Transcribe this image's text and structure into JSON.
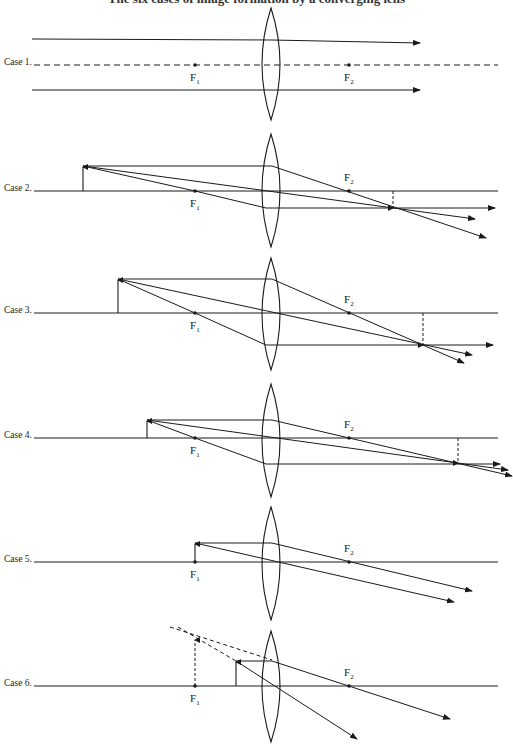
{
  "title": "The six cases of image formation by a converging lens",
  "colors": {
    "ink": "#1a1a1a",
    "background": "#ffffff"
  },
  "lens": {
    "center_x": 271,
    "half_width": 9
  },
  "focal_points": {
    "f1_x": 195,
    "f2_x": 349,
    "f1_label": "F",
    "f1_sub": "1",
    "f2_label": "F",
    "f2_sub": "2"
  },
  "cases": [
    {
      "label": "Case 1.",
      "axis_y": 65,
      "axis_style": "dashed",
      "lens_top": 8,
      "lens_bottom": 120,
      "object": null,
      "rays": [
        {
          "points": [
            [
              32,
              39
            ],
            [
              272,
              40
            ],
            [
              420,
              43
            ]
          ],
          "arrow": true,
          "style": "solid",
          "via_f2": true
        },
        {
          "points": [
            [
              32,
              90
            ],
            [
              272,
              90
            ],
            [
              420,
              90
            ]
          ],
          "arrow": true,
          "style": "solid",
          "via_f2": true
        }
      ],
      "image": null
    },
    {
      "label": "Case 2.",
      "axis_y": 191,
      "lens_top": 134,
      "lens_bottom": 247,
      "object": {
        "x": 83,
        "tip_y": 166
      },
      "rays": [
        {
          "points": [
            [
              83,
              166
            ],
            [
              272,
              166
            ],
            [
              486,
              238
            ]
          ],
          "arrow": true,
          "style": "solid"
        },
        {
          "points": [
            [
              83,
              166
            ],
            [
              475,
              219
            ]
          ],
          "arrow": true,
          "style": "solid"
        },
        {
          "points": [
            [
              83,
              166
            ],
            [
              195,
              191
            ],
            [
              266,
              208
            ],
            [
              495,
              208
            ]
          ],
          "arrow": true,
          "style": "solid"
        }
      ],
      "image": {
        "x": 393,
        "top_y": 191,
        "bottom_y": 208,
        "style": "dashed"
      }
    },
    {
      "label": "Case 3.",
      "axis_y": 313,
      "lens_top": 258,
      "lens_bottom": 370,
      "object": {
        "x": 118,
        "tip_y": 279
      },
      "rays": [
        {
          "points": [
            [
              118,
              279
            ],
            [
              272,
              279
            ],
            [
              464,
              363
            ]
          ],
          "arrow": true,
          "style": "solid"
        },
        {
          "points": [
            [
              118,
              279
            ],
            [
              472,
              355
            ]
          ],
          "arrow": true,
          "style": "solid"
        },
        {
          "points": [
            [
              118,
              279
            ],
            [
              195,
              313
            ],
            [
              266,
              345
            ],
            [
              493,
              345
            ]
          ],
          "arrow": true,
          "style": "solid"
        }
      ],
      "image": {
        "x": 423,
        "top_y": 313,
        "bottom_y": 345,
        "style": "dashed"
      }
    },
    {
      "label": "Case 4.",
      "axis_y": 438,
      "lens_top": 384,
      "lens_bottom": 497,
      "object": {
        "x": 147,
        "tip_y": 420
      },
      "rays": [
        {
          "points": [
            [
              147,
              420
            ],
            [
              272,
              420
            ],
            [
              512,
              476
            ]
          ],
          "arrow": true,
          "style": "solid"
        },
        {
          "points": [
            [
              147,
              420
            ],
            [
              508,
              470
            ]
          ],
          "arrow": true,
          "style": "solid"
        },
        {
          "points": [
            [
              147,
              420
            ],
            [
              195,
              438
            ],
            [
              266,
              464
            ],
            [
              500,
              464
            ]
          ],
          "arrow": true,
          "style": "solid"
        }
      ],
      "image": {
        "x": 458,
        "top_y": 438,
        "bottom_y": 463,
        "style": "dashed"
      }
    },
    {
      "label": "Case 5.",
      "axis_y": 562,
      "lens_top": 507,
      "lens_bottom": 620,
      "object": {
        "x": 195,
        "tip_y": 543
      },
      "rays": [
        {
          "points": [
            [
              195,
              543
            ],
            [
              272,
              543
            ],
            [
              472,
              591
            ]
          ],
          "arrow": true,
          "style": "solid"
        },
        {
          "points": [
            [
              195,
              543
            ],
            [
              454,
              602
            ]
          ],
          "arrow": true,
          "style": "solid"
        }
      ],
      "image": null
    },
    {
      "label": "Case 6.",
      "axis_y": 686,
      "lens_top": 631,
      "lens_bottom": 742,
      "object": {
        "x": 236,
        "tip_y": 661
      },
      "rays": [
        {
          "points": [
            [
              236,
              661
            ],
            [
              272,
              661
            ],
            [
              450,
              719
            ]
          ],
          "arrow": true,
          "style": "solid"
        },
        {
          "points": [
            [
              236,
              661
            ],
            [
              357,
              739
            ]
          ],
          "arrow": true,
          "style": "solid"
        },
        {
          "points": [
            [
              170,
              627
            ],
            [
              272,
              660
            ]
          ],
          "arrow": false,
          "style": "dashed"
        },
        {
          "points": [
            [
              178,
              627
            ],
            [
              236,
              661
            ]
          ],
          "arrow": false,
          "style": "dashed"
        }
      ],
      "image": {
        "x": 195,
        "top_y": 640,
        "bottom_y": 686,
        "style": "dashed",
        "virtual": true,
        "upright": true
      }
    }
  ]
}
